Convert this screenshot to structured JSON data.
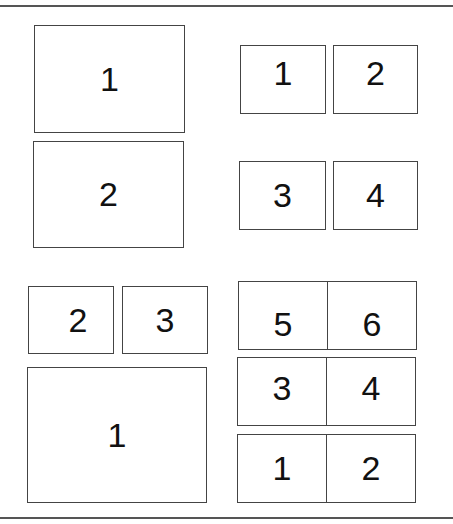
{
  "layouts": {
    "top_left": {
      "panels": [
        "1",
        "2"
      ]
    },
    "top_right": {
      "panels": [
        "1",
        "2",
        "3",
        "4"
      ]
    },
    "bottom_left": {
      "panels": [
        "2",
        "3",
        "1"
      ]
    },
    "bottom_right": {
      "rows": [
        [
          "5",
          "6"
        ],
        [
          "3",
          "4"
        ],
        [
          "1",
          "2"
        ]
      ]
    }
  },
  "colors": {
    "border": "#444444",
    "rule": "#555555",
    "background": "#ffffff"
  }
}
